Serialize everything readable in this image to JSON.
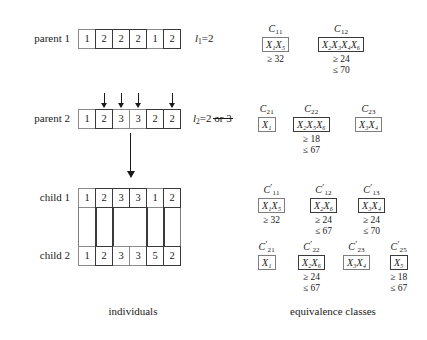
{
  "figure": {
    "captions": {
      "left": "individuals",
      "right": "equivalence classes"
    }
  },
  "individuals": {
    "rows": [
      {
        "id": "parent-1",
        "label": "parent 1",
        "genes": [
          "1",
          "2",
          "2",
          "2",
          "1",
          "2"
        ],
        "thick_cells": [
          1,
          2,
          3,
          5
        ],
        "length_label": {
          "symbol": "l",
          "subscript": "1",
          "value": "2",
          "alt_value": "",
          "alt_struck": false
        }
      },
      {
        "id": "parent-2",
        "label": "parent 2",
        "genes": [
          "1",
          "2",
          "3",
          "3",
          "2",
          "2"
        ],
        "thick_cells": [
          1,
          4,
          5
        ],
        "crossover_arrows": [
          1,
          2,
          3,
          5
        ],
        "length_label": {
          "symbol": "l",
          "subscript": "2",
          "value": "2",
          "alt_value": "or 3",
          "alt_struck": true
        }
      },
      {
        "id": "child-1",
        "label": "child 1",
        "genes": [
          "1",
          "2",
          "3",
          "3",
          "1",
          "2"
        ],
        "thick_cells": [
          1,
          2,
          3,
          5
        ],
        "length_label": null
      },
      {
        "id": "child-2",
        "label": "child 2",
        "genes": [
          "1",
          "2",
          "3",
          "3",
          "5",
          "2"
        ],
        "thick_cells": [
          1,
          4,
          5
        ],
        "length_label": null
      }
    ]
  },
  "equivalence_classes": {
    "groups": [
      {
        "row": "parent-1",
        "classes": [
          {
            "name": "C",
            "sub": "11",
            "prime": "",
            "members": "X₁X₅",
            "thick": false,
            "lower": "≥ 32",
            "upper": ""
          },
          {
            "name": "C",
            "sub": "12",
            "prime": "",
            "members": "X₂X₃X₄X₆",
            "thick": true,
            "lower": "≥ 24",
            "upper": "≤ 70"
          }
        ]
      },
      {
        "row": "parent-2",
        "classes": [
          {
            "name": "C",
            "sub": "21",
            "prime": "",
            "members": "X₁",
            "thick": false,
            "lower": "",
            "upper": ""
          },
          {
            "name": "C",
            "sub": "22",
            "prime": "",
            "members": "X₂X₅X₆",
            "thick": true,
            "lower": "≥ 18",
            "upper": "≤ 67"
          },
          {
            "name": "C",
            "sub": "23",
            "prime": "",
            "members": "X₃X₄",
            "thick": false,
            "lower": "",
            "upper": ""
          }
        ]
      },
      {
        "row": "child-1",
        "classes": [
          {
            "name": "C",
            "sub": "11",
            "prime": "′",
            "members": "X₁X₅",
            "thick": false,
            "lower": "≥ 32",
            "upper": ""
          },
          {
            "name": "C",
            "sub": "12",
            "prime": "′",
            "members": "X₂X₆",
            "thick": true,
            "lower": "≥ 24",
            "upper": "≤ 67"
          },
          {
            "name": "C",
            "sub": "13",
            "prime": "′",
            "members": "X₃X₄",
            "thick": true,
            "lower": "≥ 24",
            "upper": "≤ 70"
          }
        ]
      },
      {
        "row": "child-2",
        "classes": [
          {
            "name": "C",
            "sub": "21",
            "prime": "′",
            "members": "X₁",
            "thick": false,
            "lower": "",
            "upper": ""
          },
          {
            "name": "C",
            "sub": "22",
            "prime": "′",
            "members": "X₂X₆",
            "thick": true,
            "lower": "≥ 24",
            "upper": "≤ 67"
          },
          {
            "name": "C",
            "sub": "23",
            "prime": "′",
            "members": "X₃X₄",
            "thick": false,
            "lower": "",
            "upper": ""
          },
          {
            "name": "C",
            "sub": "25",
            "prime": "′",
            "members": "X₅",
            "thick": true,
            "lower": "≥ 18",
            "upper": "≤ 67"
          }
        ]
      }
    ]
  }
}
